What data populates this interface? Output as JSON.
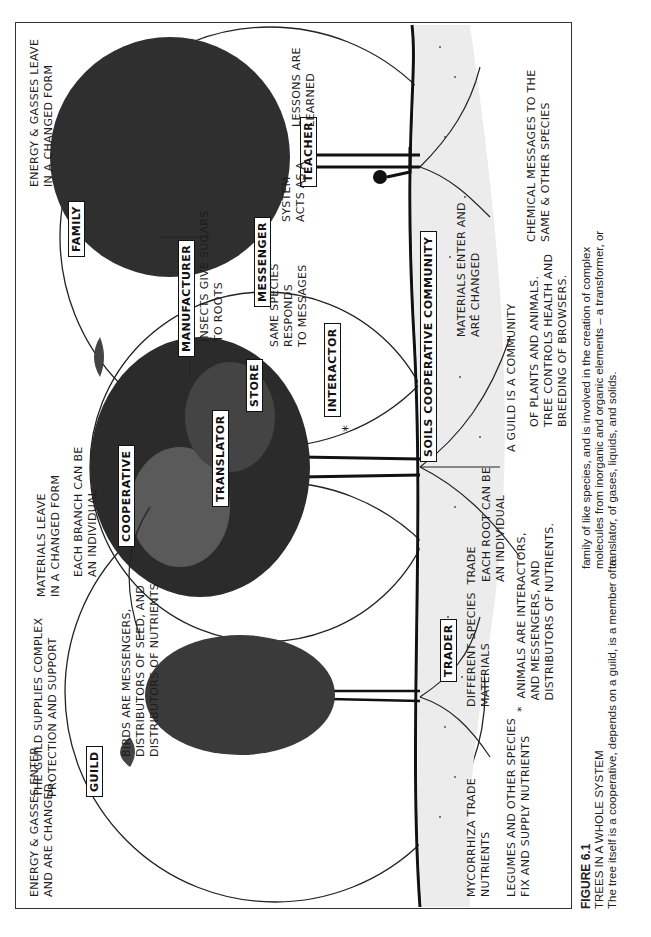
{
  "figure": {
    "number": "FIGURE 6.1",
    "title": "TREES IN A WHOLE SYSTEM",
    "caption_lines_left": [
      "The tree itself is a cooperative, depends on a guild, is a member of a"
    ],
    "caption_lines_right": [
      "family of like species, and is involved in the creation of complex",
      "molecules from inorganic and organic elements – a transformer, or",
      "translator, of gases, liquids, and solids."
    ]
  },
  "colors": {
    "ink": "#1a1a1a",
    "paper": "#ffffff",
    "frame": "#333333"
  },
  "labels": {
    "boxes": {
      "guild": "GUILD",
      "family": "FAMILY",
      "cooperative": "COOPERATIVE",
      "translator": "TRANSLATOR",
      "store": "STORE",
      "manufacturer": "MANUFACTURER",
      "messenger": "MESSENGER",
      "interactor": "INTERACTOR",
      "teacher": "TEACHER",
      "trader": "TRADER",
      "soils_community": "SOILS COOPERATIVE COMMUNITY"
    },
    "notes": {
      "energy_enter": "ENERGY & GASSES ENTER\nAND ARE CHANGED.",
      "guild_supplies": "THE GUILD SUPPLIES COMPLEX\nPROTECTION AND SUPPORT",
      "materials_leave": "MATERIALS LEAVE\nIN A CHANGED FORM",
      "each_branch": "EACH BRANCH CAN BE\nAN INDIVIDUAL",
      "energy_leave": "ENERGY & GASSES LEAVE\nIN A CHANGED FORM",
      "birds": "BIRDS ARE MESSENGERS,\nDISTRIBUTORS OF SEED, AND\nDISTRIBUTORS OF NUTRIENTS",
      "insects": "INSECTS GIVE SUGARS\nTO ROOTS",
      "same_species": "SAME SPECIES\nRESPONDS\nTO MESSAGES",
      "system_teacher": "SYSTEM\nACTS AS A",
      "lessons": "LESSONS ARE\nLEARNED",
      "different_species": "DIFFERENT SPECIES  TRADE\nMATERIALS",
      "each_root": "EACH ROOT CAN BE\nAN INDIVIDUAL",
      "materials_enter": "MATERIALS ENTER AND\nARE CHANGED",
      "guild_community": "A GUILD IS A COMMUNITY",
      "plants_animals": "OF PLANTS AND ANIMALS.\nTREE CONTROLS HEALTH AND\nBREEDING OF BROWSERS.",
      "chemical_messages": "CHEMICAL MESSAGES TO THE\nSAME & OTHER SPECIES",
      "mycorrhiza": "MYCORRHIZA TRADE\nNUTRIENTS",
      "legumes": "LEGUMES AND OTHER SPECIES\nFIX AND SUPPLY NUTRIENTS",
      "animals": "*  ANIMALS ARE INTERACTORS,\n   AND MESSENGERS, AND\n   DISTRIBUTORS OF NUTRIENTS.",
      "interactor_star": "*"
    }
  }
}
